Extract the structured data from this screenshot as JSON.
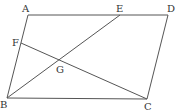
{
  "diagram": {
    "type": "geometry-parallelogram",
    "line_color": "#555555",
    "points": {
      "A": {
        "x": 28,
        "y": 15,
        "label": "A",
        "lx": 22,
        "ly": 12
      },
      "D": {
        "x": 168,
        "y": 15,
        "label": "D",
        "lx": 167,
        "ly": 12
      },
      "E": {
        "x": 120,
        "y": 15,
        "label": "E",
        "lx": 116,
        "ly": 12
      },
      "B": {
        "x": 7,
        "y": 98,
        "label": "B",
        "lx": 0,
        "ly": 108
      },
      "C": {
        "x": 147,
        "y": 99,
        "label": "C",
        "lx": 144,
        "ly": 110
      },
      "F": {
        "x": 21,
        "y": 43,
        "label": "F",
        "lx": 12,
        "ly": 46
      },
      "G": {
        "x": 60,
        "y": 61,
        "label": "G",
        "lx": 56,
        "ly": 73
      }
    },
    "segments": [
      "AD",
      "DC",
      "CB",
      "BA",
      "BE",
      "FC"
    ]
  }
}
